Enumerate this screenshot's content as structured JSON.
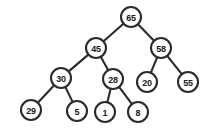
{
  "figure": {
    "type": "binary-tree-diagram",
    "background_color": "#ffffff",
    "node_fill_color": "#ffffff",
    "node_stroke_color": "#2b2b2b",
    "edge_color": "#2b2b2b",
    "label_color": "#1a1a1a",
    "node_radius": 10,
    "width": 215,
    "height": 134
  },
  "tree": {
    "root": "65",
    "nodes": [
      {
        "id": "n65",
        "label": "65",
        "cx": 131,
        "cy": 17,
        "level": 0
      },
      {
        "id": "n45",
        "label": "45",
        "cx": 96,
        "cy": 48,
        "level": 1
      },
      {
        "id": "n58",
        "label": "58",
        "cx": 161,
        "cy": 48,
        "level": 1
      },
      {
        "id": "n30",
        "label": "30",
        "cx": 61,
        "cy": 78,
        "level": 2
      },
      {
        "id": "n28",
        "label": "28",
        "cx": 113,
        "cy": 79,
        "level": 2
      },
      {
        "id": "n20",
        "label": "20",
        "cx": 147,
        "cy": 82,
        "level": 2
      },
      {
        "id": "n55",
        "label": "55",
        "cx": 188,
        "cy": 82,
        "level": 2
      },
      {
        "id": "n29",
        "label": "29",
        "cx": 31,
        "cy": 110,
        "level": 3
      },
      {
        "id": "n5",
        "label": "5",
        "cx": 77,
        "cy": 111,
        "level": 3
      },
      {
        "id": "n1",
        "label": "1",
        "cx": 105,
        "cy": 112,
        "level": 3
      },
      {
        "id": "n8",
        "label": "8",
        "cx": 138,
        "cy": 112,
        "level": 3
      }
    ],
    "edges": [
      {
        "from": "n65",
        "to": "n45",
        "side": "left"
      },
      {
        "from": "n65",
        "to": "n58",
        "side": "right"
      },
      {
        "from": "n45",
        "to": "n30",
        "side": "left"
      },
      {
        "from": "n45",
        "to": "n28",
        "side": "right"
      },
      {
        "from": "n58",
        "to": "n20",
        "side": "left"
      },
      {
        "from": "n58",
        "to": "n55",
        "side": "right"
      },
      {
        "from": "n30",
        "to": "n29",
        "side": "left"
      },
      {
        "from": "n30",
        "to": "n5",
        "side": "right"
      },
      {
        "from": "n28",
        "to": "n1",
        "side": "left"
      },
      {
        "from": "n28",
        "to": "n8",
        "side": "right"
      }
    ]
  }
}
